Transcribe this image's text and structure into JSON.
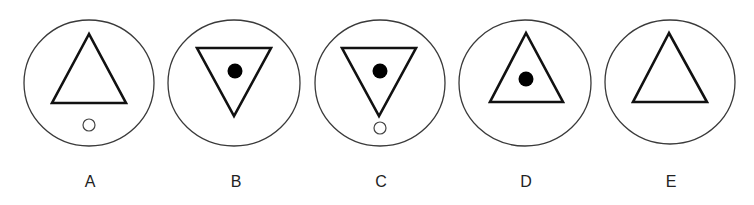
{
  "figure": {
    "options": [
      {
        "label": "A",
        "circle": {
          "cx": 89,
          "cy": 83,
          "rx": 65,
          "ry": 63
        },
        "triangle": {
          "orientation": "up",
          "points": "89,34 52,103 126,103"
        },
        "dot": null,
        "ring": {
          "cx": 89,
          "cy": 125,
          "r": 6
        }
      },
      {
        "label": "B",
        "circle": {
          "cx": 234,
          "cy": 83,
          "rx": 66,
          "ry": 63
        },
        "triangle": {
          "orientation": "down",
          "points": "197,48 271,48 234,116"
        },
        "dot": {
          "cx": 235,
          "cy": 71,
          "r": 7.5
        },
        "ring": null
      },
      {
        "label": "C",
        "circle": {
          "cx": 380,
          "cy": 83,
          "rx": 65,
          "ry": 63
        },
        "triangle": {
          "orientation": "down",
          "points": "342,48 416,48 379,116"
        },
        "dot": {
          "cx": 380,
          "cy": 71,
          "r": 7.5
        },
        "ring": {
          "cx": 380,
          "cy": 128,
          "r": 6
        }
      },
      {
        "label": "D",
        "circle": {
          "cx": 525,
          "cy": 83,
          "rx": 66,
          "ry": 63
        },
        "triangle": {
          "orientation": "up",
          "points": "526,33 490,102 563,102"
        },
        "dot": {
          "cx": 526,
          "cy": 79,
          "r": 7.5
        },
        "ring": null
      },
      {
        "label": "E",
        "circle": {
          "cx": 670,
          "cy": 82,
          "rx": 65,
          "ry": 62
        },
        "triangle": {
          "orientation": "up",
          "points": "669,33 633,102 707,102"
        },
        "dot": null,
        "ring": null
      }
    ],
    "label_positions": [
      90,
      236,
      381,
      526,
      671
    ],
    "colors": {
      "background": "#ffffff",
      "circle_stroke": "#3a3a3a",
      "triangle_stroke": "#111111",
      "dot_fill": "#000000",
      "label_text": "#222222"
    }
  }
}
